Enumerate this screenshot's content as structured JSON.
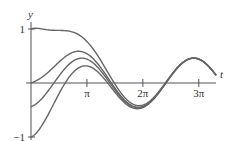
{
  "chart_data": {
    "type": "line",
    "title": "",
    "xlabel": "t",
    "ylabel": "y",
    "x_ticks": [
      {
        "value": 3.14159,
        "label": "π"
      },
      {
        "value": 6.28318,
        "label": "2π"
      },
      {
        "value": 9.42478,
        "label": "3π"
      }
    ],
    "y_ticks": [
      {
        "value": 1,
        "label": "1"
      },
      {
        "value": -1,
        "label": "−1"
      }
    ],
    "xlim": [
      0,
      10.5
    ],
    "ylim": [
      -1,
      1
    ],
    "grid": false,
    "legend": null,
    "steady_state": {
      "amplitude": 0.46,
      "phase": 1.29,
      "form": "A*sin(t - phase)"
    },
    "series": [
      {
        "name": "y(0)=1",
        "initial_value": 1
      },
      {
        "name": "y(0)=0",
        "initial_value": 0
      },
      {
        "name": "y(0)=-1",
        "initial_value": -1
      },
      {
        "name": "y(0)=-0.44 (steady-state)",
        "initial_value": -0.44
      }
    ],
    "line_color": "#666666"
  }
}
